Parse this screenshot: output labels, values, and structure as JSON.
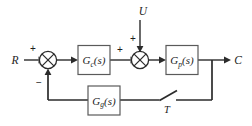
{
  "diagram": {
    "kind": "control-system-block-diagram",
    "canvas": {
      "width": 252,
      "height": 126,
      "background": "#ffffff"
    },
    "colors": {
      "wire": "#2b2b2b",
      "block_border": "#5a5a5a",
      "block_fill": "#ffffff",
      "text": "#1d1d1d"
    },
    "signals": {
      "reference": "R",
      "disturbance": "U",
      "output": "C",
      "sampler": "T"
    },
    "blocks": [
      {
        "id": "controller",
        "name": "G",
        "subscript": "c",
        "argument": "(s)",
        "label": "G_c(s)"
      },
      {
        "id": "plant",
        "name": "G",
        "subscript": "p",
        "argument": "(s)",
        "label": "G_p(s)"
      },
      {
        "id": "feedback",
        "name": "G",
        "subscript": "g",
        "argument": "(s)",
        "label": "G_g(s)"
      }
    ],
    "summing_junctions": [
      {
        "id": "summer-1",
        "inputs": [
          {
            "source": "R",
            "sign": "+",
            "position": "left"
          },
          {
            "source": "feedback",
            "sign": "-",
            "position": "bottom"
          }
        ]
      },
      {
        "id": "summer-2",
        "inputs": [
          {
            "source": "controller",
            "sign": "+",
            "position": "left"
          },
          {
            "source": "U",
            "sign": "+",
            "position": "top"
          }
        ]
      }
    ],
    "signs": {
      "reference_plus": "+",
      "feedback_minus": "−",
      "controller_out_plus": "+",
      "disturbance_plus": "+"
    }
  }
}
